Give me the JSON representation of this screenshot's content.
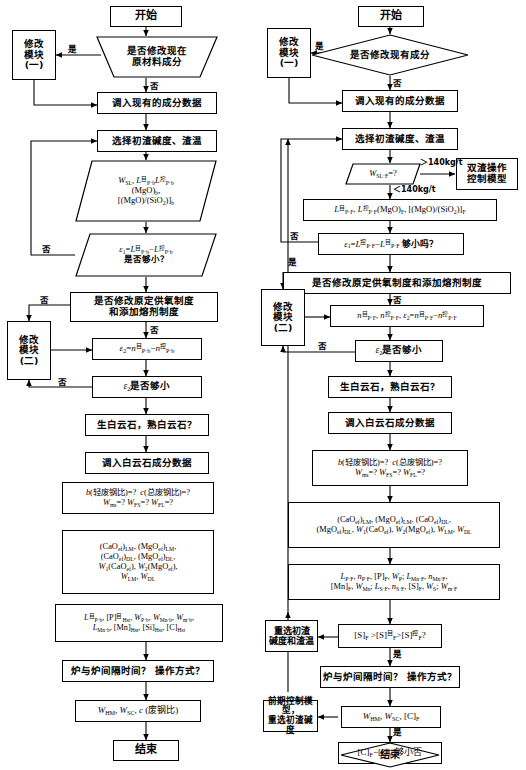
{
  "diagram": {
    "type": "flowchart",
    "columns": 2
  },
  "left": {
    "n_start": "开始",
    "n_q1": "是否修改现在<br>原材料成分",
    "n_mod1": "修改<br>模块<br>(一)",
    "n_load": "调入现有的成分数据",
    "n_select": "选择初渣碱度、渣温",
    "n_par1": "<span class=\"mi\">W</span><sub>SL</sub>, <span class=\"mi\">L</span><sup>目</sup><sub>P·b</sub><span class=\"mi\">L</span><sup>控</sup><sub>P·b</sub><br>(MgO)<sub>b</sub>,<br>[(MgO)/(SiO<sub>2</sub>)]<sub>b</sub>",
    "n_par2": "<span class=\"mi\">ε</span><sub>1</sub>=<span class=\"mi\">L</span><sup>目</sup><sub>P·b</sub>−<span class=\"mi\">L</span><sup>控</sup><sub>P·b</sub><br><span class=\"cn\">是否够小？</span>",
    "n_q2": "是否修改原定供氧制度<br>和添加熔剂制度",
    "n_mod2": "修改<br>模块<br>(二)",
    "n_eps2": "<span class=\"mi\">ε</span><sub>2</sub>=<span class=\"mi\">n</span><sup>目</sup><sub>P·b</sub>−<span class=\"mi\">n</span><sup>控</sup><sub>P·b</sub>",
    "n_eps2q": "<span class=\"mi\">ε</span><sub>2</sub><span class=\"cn\">是否够小</span>",
    "n_dol": "生白云石，熟白云石？",
    "n_doldata": "调入白云石成分数据",
    "n_scrap": "<span class=\"mi\">b</span>(轻废钢比)=?&nbsp;&nbsp;<span class=\"mi\">c</span>(总废钢比)=?<br><span class=\"mi\">W</span><sub>ms</sub>=?&nbsp;<span class=\"mi\">W</span><sub>FS</sub>=?&nbsp;<span class=\"mi\">W</span><sub>FL</sub>=?",
    "n_cao": "(CaO<sub>ef</sub>)<sub>LM</sub>, (MgO<sub>ef</sub>)<sub>LM</sub>,<br>(CaO<sub>ef</sub>)<sub>DL</sub>, (MgO<sub>ef</sub>)<sub>DL</sub>,<br><span class=\"mi\">W</span><sub>1</sub>(CaO<sub>ef</sub>), <span class=\"mi\">W</span><sub>2</sub>(MgO<sub>ef</sub>),<br><span class=\"mi\">W</span><sub>LM</sub>, <span class=\"mi\">W</span><sub>DL</sub>",
    "n_lp": "<span class=\"mi\">L</span><sup>目</sup><sub>P·b</sub>, [P]<sup>目</sup><sub>Hst</sub>, <span class=\"mi\">W</span><sub>P·b</sub>, <span class=\"mi\">W</span><sub>Mn·b</sub>, <span class=\"mi\">W</span><sub>m·b</sub>,<br><span class=\"mi\">L</span><sub>Mn·b</sub>, [Mn]<sub>Hst</sub>, [Si]<sub>Hst</sub>, [C]<sub>Hst</sub>",
    "n_time": "炉与炉间隔时间？ 操作方式？",
    "n_whm": "<span class=\"mi\">W</span><sub>HM</sub>, <span class=\"mi\">W</span><sub>SC</sub>, <span class=\"mi\">c</span> (废钢比)",
    "n_end": "结束",
    "lbl_yes_1": "是",
    "lbl_no_1": "否",
    "lbl_no_2": "否",
    "lbl_no_3": "否",
    "lbl_no_4": "否",
    "lbl_no_5": "否"
  },
  "right": {
    "n_start": "开始",
    "n_q1": "是否修改现有成分",
    "n_mod1": "修改<br>模块<br>(一)",
    "n_load": "调入现有的成分数据",
    "n_select": "选择初渣碱度、渣温",
    "n_wsl": "<span class=\"mi\">W</span><sub>SL·F</sub>=?",
    "n_dual": "双渣操作<br>控制模型",
    "n_lpf": "<span class=\"mi\">L</span><sup>目</sup><sub>P·F</sub>, <span class=\"mi\">L</span><sup>控</sup><sub>P·F</sub>(MgO)<sub>F</sub>, [(MgO)/(SiO<sub>2</sub>)]<sub>F</sub>",
    "n_eps1": "<span class=\"mi\">ε</span><sub>1</sub>=<span class=\"mi\">L</span><sup>控</sup><sub>P·F</sub>−<span class=\"mi\">L</span><sup>目</sup><sub>P·F</sub> <span class=\"cn\">够小吗？</span>",
    "n_q2": "是否修改原定供氧制度和添加熔剂制度",
    "n_mod2": "修改<br>模块<br>(二)",
    "n_npf": "<span class=\"mi\">n</span><sup>目</sup><sub>P·F</sub>, <span class=\"mi\">n</span><sup>控</sup><sub>P·F</sub>, <span class=\"mi\">ε</span><sub>2</sub>=<span class=\"mi\">n</span><sup>目</sup><sub>P·F</sub>−<span class=\"mi\">n</span><sup>控</sup><sub>P·F</sub>",
    "n_eps2q": "<span class=\"mi\">ε</span><sub>2</sub><span class=\"cn\">是否够小</span>",
    "n_dol": "生白云石，熟白云石？",
    "n_doldata": "调入白云石成分数据",
    "n_scrap": "<span class=\"mi\">b</span>(轻废钢比)=?&nbsp;&nbsp;<span class=\"mi\">c</span>(总废钢比)=?<br><span class=\"mi\">W</span><sub>ms</sub>=?&nbsp;<span class=\"mi\">W</span><sub>FS</sub>=?&nbsp;<span class=\"mi\">W</span><sub>FL</sub>=?",
    "n_cao": "(CaO<sub>ef</sub>)<sub>LM</sub>, (MgO<sub>ef</sub>)<sub>LM</sub>, (CaO<sub>ef</sub>)<sub>DL</sub>,<br>(MgO<sub>ef</sub>)<sub>DL</sub>, <span class=\"mi\">W</span><sub>1</sub>(CaO<sub>ef</sub>), <span class=\"mi\">W</span><sub>2</sub>(MgO<sub>ef</sub>), <span class=\"mi\">W</span><sub>LM</sub>, <span class=\"mi\">W</span><sub>DL</sub>",
    "n_lpf2": "<span class=\"mi\">L</span><sub>P·F</sub>, <span class=\"mi\">n</span><sub>P·F</sub>, [P]<sub>F</sub>, <span class=\"mi\">W</span><sub>P</sub>; <span class=\"mi\">L</span><sub>Mn·F</sub>, <span class=\"mi\">n</span><sub>Mn·F</sub>,<br>[Mn]<sub>F</sub>, <span class=\"mi\">W</span><sub>Mn</sub>; <span class=\"mi\">L</span><sub>S·F</sub>, <span class=\"mi\">n</span><sub>S·F</sub>, [S]<sub>F</sub>, <span class=\"mi\">W</span><sub>S</sub>; <span class=\"mi\">W</span><sub>m·F</sub>",
    "n_sq": "[S]<sub>F</sub> &gt;[S]<sup>目</sup><sub>F</sub>&gt;[S]<sup>控</sup><sub>F</sub>?",
    "n_reselect": "重选初渣<br>碱度和渣温",
    "n_time": "炉与炉间隔时间？ 操作方式？",
    "n_whm": "<span class=\"mi\">W</span><sub>HM</sub>, <span class=\"mi\">W</span><sub>SC</sub>, [C]<sub>F</sub>",
    "n_early": "前期控制模型，<br>重选初渣碱度",
    "n_cq": "[C]<sub>F</sub>−[C]<sub>b</sub> 够小否",
    "n_end": "结束",
    "lbl_yes_1": "是",
    "lbl_no_1": "否",
    "lbl_gt140": "＞140kg/t",
    "lbl_lt140": "＜140kg/t",
    "lbl_no_2": "否",
    "lbl_yes_2": "是",
    "lbl_no_3": "否",
    "lbl_no_4": "否",
    "lbl_yes_3": "是",
    "lbl_yes_4": "是",
    "lbl_yes_5": "是"
  },
  "colors": {
    "stroke": "#000000",
    "background": "#ffffff"
  }
}
